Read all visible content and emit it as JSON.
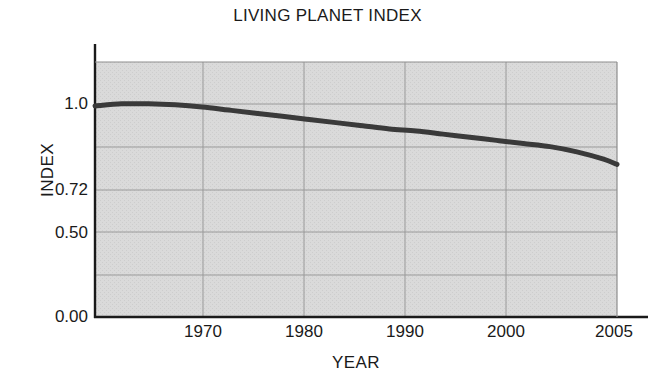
{
  "chart_data": {
    "type": "line",
    "title": "LIVING PLANET INDEX",
    "xlabel": "YEAR",
    "ylabel": "INDEX",
    "xlim": [
      1966,
      2005
    ],
    "ylim": [
      0.0,
      1.22
    ],
    "grid": true,
    "legend": "none",
    "background_color": "#d7d7d7",
    "line_color": "#3a3a3a",
    "gridline_color": "#9a9a9a",
    "axis_color": "#1a1a1a",
    "xticks": [
      "1970",
      "1980",
      "1990",
      "2000",
      "2005"
    ],
    "xtick_values": [
      1970,
      1980,
      1990,
      2000,
      2005
    ],
    "yticks": [
      "1.0",
      "0.72",
      "0.50",
      "0.00"
    ],
    "ytick_values": [
      1.0,
      0.72,
      0.5,
      0.0
    ],
    "series": [
      {
        "name": "Living Planet Index",
        "x": [
          1966,
          1968,
          1970,
          1972,
          1974,
          1976,
          1978,
          1980,
          1982,
          1984,
          1986,
          1988,
          1990,
          1992,
          1994,
          1996,
          1998,
          2000,
          2002,
          2004,
          2005
        ],
        "values": [
          1.01,
          1.02,
          1.02,
          1.015,
          1.005,
          0.99,
          0.975,
          0.96,
          0.945,
          0.93,
          0.915,
          0.9,
          0.89,
          0.875,
          0.86,
          0.845,
          0.83,
          0.815,
          0.79,
          0.755,
          0.73
        ]
      }
    ],
    "annotations": []
  }
}
